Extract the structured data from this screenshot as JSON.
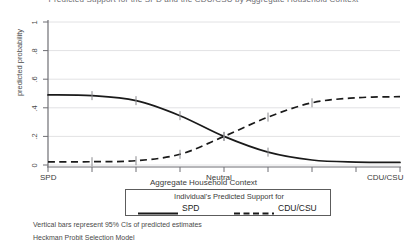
{
  "chart_data": {
    "type": "line",
    "title": "Predicted Support for the SPD and the CDU/CSU by Aggregate Household Context",
    "xlabel": "Aggregate Household Context",
    "ylabel": "predicted probability",
    "ylim": [
      0,
      1
    ],
    "yticks": [
      "0",
      ".2",
      ".4",
      ".6",
      ".8",
      "1"
    ],
    "ytick_values": [
      0,
      0.2,
      0.4,
      0.6,
      0.8,
      1
    ],
    "xlim": [
      0,
      8
    ],
    "xtick_labels": [
      "SPD",
      "Neutral",
      "CDU/CSU"
    ],
    "xtick_positions": [
      0,
      4,
      8
    ],
    "grid": "horizontal",
    "legend_position": "below-axis",
    "legend_title": "Individual's Predicted Support for",
    "series": [
      {
        "name": "SPD",
        "style": "solid",
        "color": "#1a1a1a",
        "x": [
          0,
          1,
          2,
          3,
          4,
          5,
          6,
          7,
          8
        ],
        "values": [
          0.49,
          0.485,
          0.45,
          0.345,
          0.2,
          0.09,
          0.035,
          0.02,
          0.018
        ],
        "ci_marker_x": [
          1,
          2,
          3,
          4,
          5
        ],
        "ci_marker_values": [
          0.485,
          0.45,
          0.345,
          0.2,
          0.09
        ]
      },
      {
        "name": "CDU/CSU",
        "style": "dashed",
        "color": "#1a1a1a",
        "x": [
          0,
          1,
          2,
          3,
          4,
          5,
          6,
          7,
          8
        ],
        "values": [
          0.022,
          0.023,
          0.03,
          0.075,
          0.2,
          0.335,
          0.435,
          0.47,
          0.478
        ],
        "ci_marker_x": [
          1,
          2,
          3,
          4,
          5,
          6
        ],
        "ci_marker_values": [
          0.023,
          0.03,
          0.075,
          0.2,
          0.335,
          0.435
        ]
      }
    ],
    "annotations": [
      "Vertical bars represent 95% CIs of predicted estimates",
      "Heckman Probit Selection Model"
    ]
  },
  "legend": {
    "title": "Individual's Predicted Support for",
    "entries": [
      {
        "label": "SPD",
        "style": "solid"
      },
      {
        "label": "CDU/CSU",
        "style": "dashed"
      }
    ]
  },
  "footnotes": {
    "line1": "Vertical bars represent 95% CIs of predicted estimates",
    "line2": "Heckman Probit Selection Model"
  },
  "axes": {
    "y_label": "predicted probability",
    "x_label": "Aggregate Household Context",
    "y_ticks": [
      "1",
      ".8",
      ".6",
      ".4",
      ".2",
      "0"
    ],
    "x_ticks": [
      "SPD",
      "Neutral",
      "CDU/CSU"
    ]
  }
}
